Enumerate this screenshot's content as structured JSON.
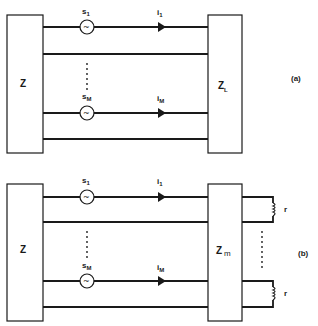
{
  "figure": {
    "panel_a": {
      "tag": "(a)",
      "left_block": {
        "label": "Z"
      },
      "right_block": {
        "label": "Z",
        "subscript": "L"
      },
      "sources": [
        {
          "label": "s",
          "subscript": "1",
          "symbol": "~"
        },
        {
          "label": "s",
          "subscript": "M",
          "symbol": "~"
        }
      ],
      "currents": [
        {
          "label": "i",
          "subscript": "1"
        },
        {
          "label": "i",
          "subscript": "M"
        }
      ]
    },
    "panel_b": {
      "tag": "(b)",
      "left_block": {
        "label": "Z"
      },
      "right_block": {
        "label": "Z",
        "subscript": "m"
      },
      "sources": [
        {
          "label": "s",
          "subscript": "1",
          "symbol": "~"
        },
        {
          "label": "s",
          "subscript": "M",
          "symbol": "~"
        }
      ],
      "currents": [
        {
          "label": "i",
          "subscript": "1"
        },
        {
          "label": "i",
          "subscript": "M"
        }
      ],
      "loads": [
        {
          "label": "r"
        },
        {
          "label": "r"
        }
      ]
    }
  }
}
